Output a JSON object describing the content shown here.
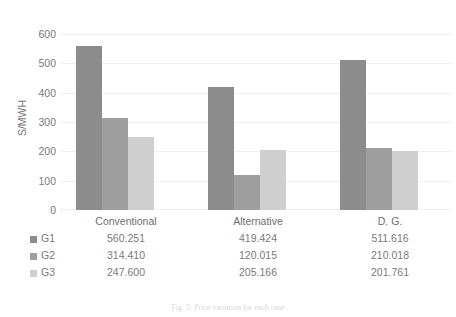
{
  "chart_data": {
    "type": "bar",
    "title": "",
    "xlabel": "",
    "ylabel": "S/MWH",
    "ylim": [
      0,
      600
    ],
    "yticks": [
      600,
      500,
      400,
      300,
      200,
      100,
      0
    ],
    "grid": true,
    "legend_position": "table-left",
    "categories": [
      "Conventional",
      "Alternative",
      "D. G."
    ],
    "series": [
      {
        "name": "G1",
        "color": "#8c8c8c",
        "values": [
          560.251,
          419.424,
          511.616
        ]
      },
      {
        "name": "G2",
        "color": "#9e9e9e",
        "values": [
          314.41,
          120.015,
          210.018
        ]
      },
      {
        "name": "G3",
        "color": "#cfcfcf",
        "values": [
          247.6,
          205.166,
          201.761
        ]
      }
    ],
    "table": {
      "header": [
        "",
        "Conventional",
        "Alternative",
        "D. G."
      ],
      "rows": [
        {
          "label": "G1",
          "cells": [
            "560.251",
            "419.424",
            "511.616"
          ]
        },
        {
          "label": "G2",
          "cells": [
            "314.410",
            "120.015",
            "210.018"
          ]
        },
        {
          "label": "G3",
          "cells": [
            "247.600",
            "205.166",
            "201.761"
          ]
        }
      ]
    }
  },
  "caption": "Fig. 5.  Price variation for each case",
  "colors": {
    "g1": "#8c8c8c",
    "g2": "#9e9e9e",
    "g3": "#cfcfcf",
    "grid": "#f0f0f0",
    "text": "#7a7a7a"
  }
}
